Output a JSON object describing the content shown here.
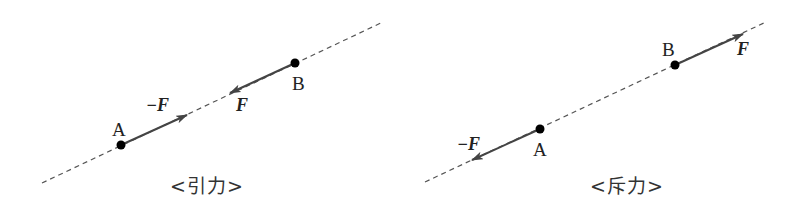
{
  "panels": [
    {
      "id": "attraction",
      "caption": "<引力>",
      "line": {
        "x1": 42,
        "y1": 183,
        "x2": 383,
        "y2": 22
      },
      "points": [
        {
          "label": "A",
          "x": 121,
          "y": 145,
          "label_x": 112,
          "label_y": 120
        },
        {
          "label": "B",
          "x": 295,
          "y": 63,
          "label_x": 292,
          "label_y": 74
        }
      ],
      "vectors": [
        {
          "label": "−F",
          "from": "A",
          "x1": 121,
          "y1": 145,
          "x2": 187,
          "y2": 115,
          "label_x": 146,
          "label_y": 96
        },
        {
          "label": "F",
          "from": "B",
          "x1": 295,
          "y1": 63,
          "x2": 230,
          "y2": 93,
          "label_x": 236,
          "label_y": 96
        }
      ]
    },
    {
      "id": "repulsion",
      "caption": "<斥力>",
      "line": {
        "x1": 425,
        "y1": 182,
        "x2": 766,
        "y2": 22
      },
      "points": [
        {
          "label": "A",
          "x": 540,
          "y": 129,
          "label_x": 533,
          "label_y": 140
        },
        {
          "label": "B",
          "x": 675,
          "y": 65,
          "label_x": 662,
          "label_y": 40
        }
      ],
      "vectors": [
        {
          "label": "−F",
          "from": "A",
          "x1": 540,
          "y1": 129,
          "x2": 472,
          "y2": 160,
          "label_x": 457,
          "label_y": 135
        },
        {
          "label": "F",
          "from": "B",
          "x1": 675,
          "y1": 65,
          "x2": 743,
          "y2": 34,
          "label_x": 737,
          "label_y": 40
        }
      ]
    }
  ],
  "colors": {
    "line": "#555555",
    "vector": "#444444",
    "point": "#000000",
    "text": "#222222"
  },
  "captions": {
    "left": {
      "text": "<引力>",
      "x": 170,
      "y": 177
    },
    "right": {
      "text": "<斥力>",
      "x": 590,
      "y": 177
    }
  }
}
